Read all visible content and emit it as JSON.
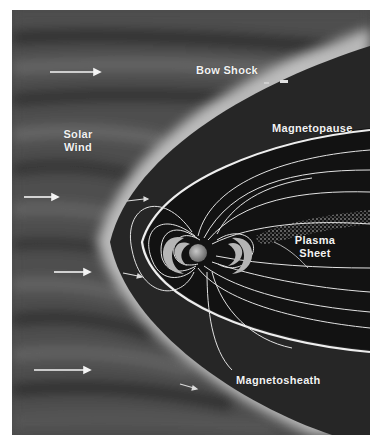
{
  "diagram": {
    "labels": {
      "bow_shock": "Bow Shock",
      "solar_wind_line1": "Solar",
      "solar_wind_line2": "Wind",
      "magnetopause": "Magnetopause",
      "plasma_sheet_line1": "Plasma",
      "plasma_sheet_line2": "Sheet",
      "magnetosheath": "Magnetosheath"
    },
    "colors": {
      "solar_wind_bg": "#4a4a4a",
      "bow_shock_glow": "#d8d8d8",
      "magnetosheath": "#2a2a2a",
      "magnetosphere": "#141414",
      "field_lines": "#e6e6e6",
      "earth": "#9a9a9a",
      "label_text": "#f2f2f2"
    },
    "icons": {
      "solar_wind_arrows": "arrow-right-icon",
      "earth": "earth-icon",
      "plasma_sheet_dots": "stipple-pattern"
    }
  }
}
